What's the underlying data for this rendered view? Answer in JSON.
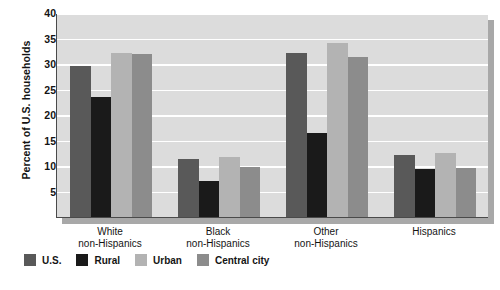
{
  "chart_data": {
    "type": "bar",
    "title": "",
    "xlabel": "",
    "ylabel": "Percent of U.S. households",
    "ylim": [
      0,
      40
    ],
    "yticks": [
      40,
      35,
      30,
      25,
      20,
      15,
      10,
      5
    ],
    "grid": true,
    "legend_position": "bottom-left",
    "categories": [
      "White non-Hispanics",
      "Black non-Hispanics",
      "Other non-Hispanics",
      "Hispanics"
    ],
    "category_lines": [
      [
        "White",
        "non-Hispanics"
      ],
      [
        "Black",
        "non-Hispanics"
      ],
      [
        "Other",
        "non-Hispanics"
      ],
      [
        "Hispanics",
        ""
      ]
    ],
    "series": [
      {
        "name": "U.S.",
        "color": "#595959",
        "values": [
          29.6,
          11.3,
          32.2,
          12.1
        ]
      },
      {
        "name": "Rural",
        "color": "#1a1a1a",
        "values": [
          23.5,
          7.0,
          16.5,
          9.5
        ]
      },
      {
        "name": "Urban",
        "color": "#b3b3b3",
        "values": [
          32.1,
          11.8,
          34.1,
          12.6
        ]
      },
      {
        "name": "Central city",
        "color": "#8c8c8c",
        "values": [
          32.0,
          9.9,
          31.4,
          9.7
        ]
      }
    ]
  },
  "legend": {
    "items": [
      {
        "label": "U.S.",
        "color": "#595959"
      },
      {
        "label": "Rural",
        "color": "#1a1a1a"
      },
      {
        "label": "Urban",
        "color": "#b3b3b3"
      },
      {
        "label": "Central city",
        "color": "#8c8c8c"
      }
    ]
  },
  "colors": {
    "plot_background": "#dcdcdc",
    "page_background": "#ffffff",
    "gridline": "#ffffff",
    "axis": "#4a4a4a",
    "shadow": "#a8a8a8",
    "text": "#141414"
  }
}
